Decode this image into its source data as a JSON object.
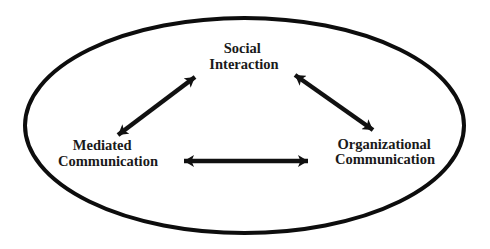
{
  "diagram": {
    "type": "concept-relationship",
    "container": {
      "shape": "ellipse",
      "stroke_color": "#0d0d0d"
    },
    "nodes": [
      {
        "id": "social-interaction",
        "line1": "Social",
        "line2": "Interaction"
      },
      {
        "id": "mediated-communication",
        "line1": "Mediated",
        "line2": "Communication"
      },
      {
        "id": "organizational-communication",
        "line1": "Organizational",
        "line2": "Communication"
      }
    ],
    "edges": [
      {
        "from": "social-interaction",
        "to": "mediated-communication",
        "direction": "bidirectional"
      },
      {
        "from": "social-interaction",
        "to": "organizational-communication",
        "direction": "bidirectional"
      },
      {
        "from": "mediated-communication",
        "to": "organizational-communication",
        "direction": "bidirectional"
      }
    ],
    "colors": {
      "line": "#111111",
      "text": "#1a1a1a",
      "background": "#ffffff"
    }
  }
}
